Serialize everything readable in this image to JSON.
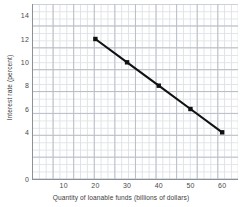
{
  "chart_data": {
    "type": "line",
    "title": "",
    "xlabel": "Quantity of loanable funds (billions of dollars)",
    "ylabel": "Interest rate (percent)",
    "xlim": [
      0,
      65
    ],
    "ylim": [
      0,
      15
    ],
    "grid": true,
    "legend": "none",
    "xticks": [
      10,
      20,
      30,
      40,
      50,
      60
    ],
    "xtick_labels": [
      "10",
      "20",
      "30",
      "40",
      "50",
      "60"
    ],
    "yticks": [
      0,
      4,
      6,
      8,
      10,
      12,
      14
    ],
    "ytick_labels": [
      "0",
      "4",
      "6",
      "8",
      "10",
      "12",
      "14"
    ],
    "series": [
      {
        "name": "Demand for loanable funds",
        "color": "#111111",
        "marker": "square",
        "x": [
          20,
          30,
          40,
          50,
          60
        ],
        "y": [
          12,
          10,
          8,
          6,
          4
        ]
      }
    ]
  },
  "points": [
    {
      "x": 20,
      "y": 12
    },
    {
      "x": 30,
      "y": 10
    },
    {
      "x": 40,
      "y": 8
    },
    {
      "x": 50,
      "y": 6
    },
    {
      "x": 60,
      "y": 4
    }
  ],
  "style": {
    "line_color": "#111111",
    "major_grid_color": "#b9bec7",
    "minor_grid_color": "#dfe3e8",
    "axis_color": "#8b9099",
    "text_color": "#3d3d3d",
    "background": "#ffffff"
  }
}
